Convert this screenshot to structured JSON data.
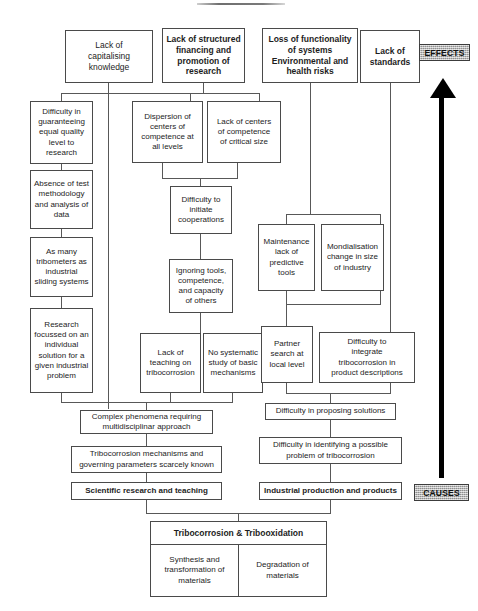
{
  "diagram": {
    "title_rule": "",
    "badges": {
      "effects": "EFFECTS",
      "causes": "CAUSES"
    },
    "arrow": {
      "name": "causes-to-effects-arrow",
      "direction": "up"
    },
    "nodes": {
      "lack_capitalising": "Lack of\ncapitalising\nknowledge",
      "lack_structured_financing": "Lack of structured\nfinancing and\npromotion of\nresearch",
      "loss_functionality": "Loss of functionality\nof systems\nEnvironmental and\nhealth risks",
      "lack_standards": "Lack of\nstandards",
      "difficulty_guaranteeing": "Difficulty in\nguaranteeing\nequal quality\nlevel to\nresearch",
      "dispersion_centers": "Dispersion of\ncenters of\ncompetence at\nall levels",
      "lack_centers_critical": "Lack of centers\nof competence\nof critical size",
      "absence_test_methodology": "Absence of test\nmethodology\nand analysis of\ndata",
      "difficulty_initiate_coop": "Difficulty to\ninitiate\ncooperations",
      "as_many_tribometers": "As many\ntribometers as\nindustrial\nsliding systems",
      "ignoring_tools": "Ignoring  tools,\ncompetence,\nand capacity\nof others",
      "maintenance_lack": "Maintenance\nlack of\npredictive\ntools",
      "mondialisation": "Mondialisation\nchange in size\nof industry",
      "research_focussed": "Research\nfocussed on an\nindividual\nsolution for a\ngiven industrial\nproblem",
      "lack_teaching": "Lack of\nteaching on\ntribocorrosion",
      "no_systematic_study": "No systematic\nstudy of basic\nmechanisms",
      "partner_search": "Partner\nsearch at\nlocal level",
      "difficulty_integrate": "Difficulty to\nintegrate\ntribocorrosion in\nproduct descriptions",
      "complex_phenomena": "Complex phenomena requiring\nmultidisciplinar approach",
      "difficulty_proposing": "Difficulty in proposing solutions",
      "tribocorrosion_mechanisms": "Tribocorrosion mechanisms and\ngoverning parameters scarcely known",
      "difficulty_identifying": "Difficulty in identifying a possible\nproblem of tribocorrosion",
      "scientific_research": "Scientific research and teaching",
      "industrial_production": "Industrial production and products"
    },
    "bottom": {
      "header": "Tribocorrosion & Tribooxidation",
      "left_cell": "Synthesis and\ntransformation of\nmaterials",
      "right_cell": "Degradation of\nmaterials"
    },
    "colors": {
      "box_border": "#4a4a4a",
      "connector": "#585858",
      "badge_fill": "#b6b6b6",
      "arrow": "#000000",
      "text": "#1d1d1d"
    }
  }
}
